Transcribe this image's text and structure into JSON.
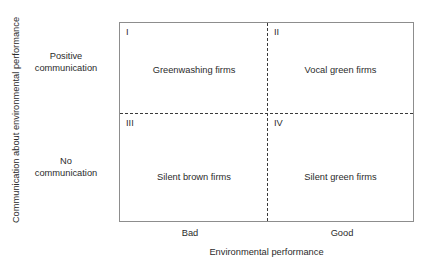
{
  "figure": {
    "type": "2x2-matrix-diagram",
    "axes": {
      "y": {
        "title": "Communication about environmental performance",
        "categories": [
          {
            "id": "positive",
            "line1": "Positive",
            "line2": "communication"
          },
          {
            "id": "none",
            "line1": "No",
            "line2": "communication"
          }
        ]
      },
      "x": {
        "title": "Environmental performance",
        "ticks": [
          "Bad",
          "Good"
        ]
      }
    },
    "quadrants": [
      {
        "numeral": "I",
        "label": "Greenwashing firms"
      },
      {
        "numeral": "II",
        "label": "Vocal green firms"
      },
      {
        "numeral": "III",
        "label": "Silent brown firms"
      },
      {
        "numeral": "IV",
        "label": "Silent green firms"
      }
    ]
  },
  "chart_data": {
    "type": "table",
    "title": "",
    "xlabel": "Environmental performance",
    "ylabel": "Communication about environmental performance",
    "x_categories": [
      "Bad",
      "Good"
    ],
    "y_categories": [
      "Positive communication",
      "No communication"
    ],
    "grid": false,
    "legend": "none",
    "cells": [
      {
        "quadrant": "I",
        "x": "Bad",
        "y": "Positive communication",
        "label": "Greenwashing firms"
      },
      {
        "quadrant": "II",
        "x": "Good",
        "y": "Positive communication",
        "label": "Vocal green firms"
      },
      {
        "quadrant": "III",
        "x": "Bad",
        "y": "No communication",
        "label": "Silent brown firms"
      },
      {
        "quadrant": "IV",
        "x": "Good",
        "y": "No communication",
        "label": "Silent green firms"
      }
    ]
  }
}
